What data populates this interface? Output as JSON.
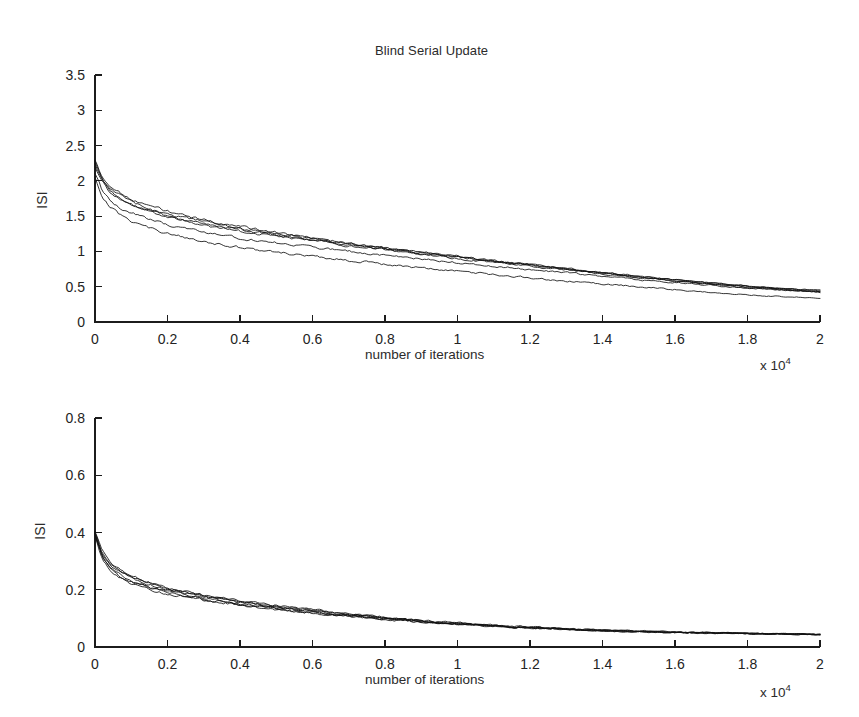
{
  "figure": {
    "title": "Blind Serial Update",
    "width": 859,
    "height": 717,
    "background": "#ffffff",
    "line_color": "#111111"
  },
  "panels": {
    "top": {
      "name": "top-panel",
      "title": "Blind Serial Update",
      "ylabel": "ISI",
      "xlabel": "number of iterations",
      "x_multiplier": "x 10",
      "x_multiplier_exponent": "4",
      "ylim": [
        0,
        3.5
      ],
      "xlim": [
        0,
        2
      ],
      "yticks": [
        "0",
        "0.5",
        "1",
        "1.5",
        "2",
        "2.5",
        "3",
        "3.5"
      ],
      "xticks": [
        "0",
        "0.2",
        "0.4",
        "0.6",
        "0.8",
        "1",
        "1.2",
        "1.4",
        "1.6",
        "1.8",
        "2"
      ]
    },
    "bottom": {
      "name": "bottom-panel",
      "ylabel": "ISI",
      "xlabel": "number of iterations",
      "x_multiplier": "x 10",
      "x_multiplier_exponent": "4",
      "ylim": [
        0,
        0.8
      ],
      "xlim": [
        0,
        2
      ],
      "yticks": [
        "0",
        "0.2",
        "0.4",
        "0.6",
        "0.8"
      ],
      "xticks": [
        "0",
        "0.2",
        "0.4",
        "0.6",
        "0.8",
        "1",
        "1.2",
        "1.4",
        "1.6",
        "1.8",
        "2"
      ]
    }
  },
  "chart_data": [
    {
      "type": "line",
      "title": "Blind Serial Update",
      "xlabel": "number of iterations",
      "ylabel": "ISI",
      "x_multiplier": 10000,
      "xlim": [
        0,
        2
      ],
      "ylim": [
        0,
        3.5
      ],
      "xticks": [
        0,
        0.2,
        0.4,
        0.6,
        0.8,
        1,
        1.2,
        1.4,
        1.6,
        1.8,
        2
      ],
      "yticks": [
        0,
        0.5,
        1,
        1.5,
        2,
        2.5,
        3,
        3.5
      ],
      "grid": false,
      "legend": null,
      "x": [
        0,
        0.02,
        0.04,
        0.06,
        0.08,
        0.1,
        0.15,
        0.2,
        0.25,
        0.3,
        0.35,
        0.4,
        0.45,
        0.5,
        0.55,
        0.6,
        0.65,
        0.7,
        0.75,
        0.8,
        0.85,
        0.9,
        0.95,
        1.0,
        1.05,
        1.1,
        1.15,
        1.2,
        1.25,
        1.3,
        1.35,
        1.4,
        1.45,
        1.5,
        1.55,
        1.6,
        1.65,
        1.7,
        1.75,
        1.8,
        1.85,
        1.9,
        1.95,
        2.0
      ],
      "series": [
        {
          "name": "run-1",
          "values": [
            2.3,
            2.05,
            1.94,
            1.86,
            1.8,
            1.75,
            1.65,
            1.57,
            1.5,
            1.45,
            1.4,
            1.35,
            1.31,
            1.27,
            1.23,
            1.19,
            1.15,
            1.12,
            1.08,
            1.05,
            1.02,
            0.99,
            0.96,
            0.93,
            0.9,
            0.87,
            0.84,
            0.81,
            0.78,
            0.75,
            0.72,
            0.69,
            0.66,
            0.63,
            0.61,
            0.58,
            0.56,
            0.54,
            0.52,
            0.5,
            0.48,
            0.46,
            0.45,
            0.44
          ]
        },
        {
          "name": "run-2",
          "values": [
            2.25,
            2.02,
            1.9,
            1.82,
            1.76,
            1.71,
            1.61,
            1.53,
            1.47,
            1.42,
            1.37,
            1.33,
            1.29,
            1.25,
            1.21,
            1.18,
            1.14,
            1.11,
            1.08,
            1.04,
            1.01,
            0.98,
            0.95,
            0.92,
            0.89,
            0.87,
            0.84,
            0.81,
            0.78,
            0.76,
            0.73,
            0.7,
            0.68,
            0.65,
            0.62,
            0.6,
            0.57,
            0.55,
            0.53,
            0.51,
            0.49,
            0.47,
            0.46,
            0.45
          ]
        },
        {
          "name": "run-3",
          "values": [
            2.2,
            1.98,
            1.85,
            1.77,
            1.71,
            1.66,
            1.57,
            1.5,
            1.44,
            1.39,
            1.35,
            1.31,
            1.27,
            1.23,
            1.2,
            1.16,
            1.13,
            1.1,
            1.06,
            1.03,
            1.0,
            0.97,
            0.94,
            0.92,
            0.89,
            0.86,
            0.83,
            0.81,
            0.78,
            0.75,
            0.73,
            0.7,
            0.67,
            0.65,
            0.62,
            0.6,
            0.57,
            0.55,
            0.53,
            0.51,
            0.49,
            0.47,
            0.45,
            0.43
          ]
        },
        {
          "name": "run-4",
          "values": [
            2.28,
            2.0,
            1.87,
            1.78,
            1.71,
            1.66,
            1.56,
            1.48,
            1.42,
            1.37,
            1.33,
            1.29,
            1.25,
            1.22,
            1.18,
            1.15,
            1.12,
            1.08,
            1.05,
            1.02,
            0.99,
            0.96,
            0.93,
            0.9,
            0.87,
            0.85,
            0.82,
            0.79,
            0.76,
            0.74,
            0.71,
            0.68,
            0.66,
            0.63,
            0.61,
            0.58,
            0.56,
            0.54,
            0.51,
            0.49,
            0.47,
            0.45,
            0.44,
            0.42
          ]
        },
        {
          "name": "run-5",
          "values": [
            2.1,
            1.86,
            1.73,
            1.65,
            1.59,
            1.54,
            1.45,
            1.38,
            1.32,
            1.27,
            1.23,
            1.19,
            1.15,
            1.12,
            1.09,
            1.06,
            1.03,
            1.0,
            0.97,
            0.94,
            0.92,
            0.89,
            0.87,
            0.84,
            0.82,
            0.79,
            0.77,
            0.74,
            0.72,
            0.7,
            0.67,
            0.65,
            0.63,
            0.6,
            0.58,
            0.56,
            0.54,
            0.52,
            0.5,
            0.48,
            0.47,
            0.45,
            0.44,
            0.43
          ]
        },
        {
          "name": "run-6",
          "values": [
            2.05,
            1.78,
            1.64,
            1.55,
            1.48,
            1.43,
            1.33,
            1.25,
            1.19,
            1.14,
            1.1,
            1.06,
            1.02,
            0.99,
            0.96,
            0.93,
            0.9,
            0.87,
            0.85,
            0.82,
            0.79,
            0.77,
            0.74,
            0.72,
            0.7,
            0.67,
            0.65,
            0.63,
            0.6,
            0.58,
            0.56,
            0.54,
            0.52,
            0.5,
            0.48,
            0.46,
            0.44,
            0.42,
            0.4,
            0.39,
            0.37,
            0.36,
            0.35,
            0.34
          ]
        }
      ]
    },
    {
      "type": "line",
      "title": "",
      "xlabel": "number of iterations",
      "ylabel": "ISI",
      "x_multiplier": 10000,
      "xlim": [
        0,
        2
      ],
      "ylim": [
        0,
        0.8
      ],
      "xticks": [
        0,
        0.2,
        0.4,
        0.6,
        0.8,
        1,
        1.2,
        1.4,
        1.6,
        1.8,
        2
      ],
      "yticks": [
        0,
        0.2,
        0.4,
        0.6,
        0.8
      ],
      "grid": false,
      "legend": null,
      "x": [
        0,
        0.02,
        0.04,
        0.06,
        0.08,
        0.1,
        0.15,
        0.2,
        0.25,
        0.3,
        0.35,
        0.4,
        0.45,
        0.5,
        0.55,
        0.6,
        0.65,
        0.7,
        0.75,
        0.8,
        0.85,
        0.9,
        0.95,
        1.0,
        1.05,
        1.1,
        1.15,
        1.2,
        1.25,
        1.3,
        1.35,
        1.4,
        1.45,
        1.5,
        1.55,
        1.6,
        1.65,
        1.7,
        1.75,
        1.8,
        1.85,
        1.9,
        1.95,
        2.0
      ],
      "series": [
        {
          "name": "run-1",
          "values": [
            0.4,
            0.33,
            0.295,
            0.272,
            0.256,
            0.244,
            0.221,
            0.205,
            0.192,
            0.18,
            0.17,
            0.16,
            0.151,
            0.143,
            0.135,
            0.128,
            0.121,
            0.114,
            0.108,
            0.102,
            0.096,
            0.091,
            0.086,
            0.082,
            0.078,
            0.074,
            0.071,
            0.068,
            0.065,
            0.062,
            0.06,
            0.058,
            0.056,
            0.054,
            0.052,
            0.051,
            0.05,
            0.049,
            0.048,
            0.047,
            0.046,
            0.045,
            0.045,
            0.044
          ]
        },
        {
          "name": "run-2",
          "values": [
            0.398,
            0.325,
            0.29,
            0.268,
            0.252,
            0.24,
            0.217,
            0.201,
            0.188,
            0.176,
            0.166,
            0.157,
            0.148,
            0.14,
            0.133,
            0.126,
            0.119,
            0.113,
            0.107,
            0.101,
            0.096,
            0.091,
            0.086,
            0.082,
            0.078,
            0.075,
            0.071,
            0.068,
            0.065,
            0.063,
            0.06,
            0.058,
            0.056,
            0.055,
            0.053,
            0.052,
            0.051,
            0.05,
            0.049,
            0.048,
            0.047,
            0.046,
            0.046,
            0.045
          ]
        },
        {
          "name": "run-3",
          "values": [
            0.395,
            0.318,
            0.282,
            0.26,
            0.244,
            0.232,
            0.21,
            0.195,
            0.182,
            0.171,
            0.161,
            0.152,
            0.144,
            0.136,
            0.129,
            0.122,
            0.116,
            0.11,
            0.104,
            0.099,
            0.094,
            0.089,
            0.085,
            0.081,
            0.077,
            0.074,
            0.07,
            0.067,
            0.065,
            0.062,
            0.06,
            0.058,
            0.056,
            0.054,
            0.052,
            0.051,
            0.05,
            0.049,
            0.048,
            0.047,
            0.046,
            0.045,
            0.044,
            0.043
          ]
        },
        {
          "name": "run-4",
          "values": [
            0.402,
            0.335,
            0.3,
            0.277,
            0.261,
            0.248,
            0.225,
            0.208,
            0.194,
            0.182,
            0.172,
            0.162,
            0.153,
            0.145,
            0.137,
            0.13,
            0.123,
            0.116,
            0.11,
            0.104,
            0.098,
            0.093,
            0.088,
            0.084,
            0.08,
            0.076,
            0.073,
            0.07,
            0.067,
            0.064,
            0.062,
            0.06,
            0.057,
            0.056,
            0.054,
            0.052,
            0.051,
            0.05,
            0.049,
            0.048,
            0.047,
            0.046,
            0.045,
            0.044
          ]
        },
        {
          "name": "run-5",
          "values": [
            0.393,
            0.312,
            0.277,
            0.255,
            0.24,
            0.228,
            0.206,
            0.191,
            0.179,
            0.168,
            0.158,
            0.149,
            0.141,
            0.134,
            0.127,
            0.12,
            0.114,
            0.108,
            0.103,
            0.098,
            0.093,
            0.088,
            0.084,
            0.08,
            0.076,
            0.073,
            0.07,
            0.067,
            0.064,
            0.062,
            0.059,
            0.057,
            0.055,
            0.054,
            0.052,
            0.051,
            0.05,
            0.049,
            0.048,
            0.047,
            0.046,
            0.045,
            0.044,
            0.043
          ]
        },
        {
          "name": "run-6",
          "values": [
            0.388,
            0.306,
            0.27,
            0.249,
            0.234,
            0.222,
            0.201,
            0.187,
            0.175,
            0.164,
            0.155,
            0.146,
            0.139,
            0.131,
            0.125,
            0.118,
            0.112,
            0.107,
            0.101,
            0.096,
            0.092,
            0.087,
            0.083,
            0.079,
            0.076,
            0.072,
            0.069,
            0.067,
            0.064,
            0.062,
            0.059,
            0.057,
            0.056,
            0.054,
            0.053,
            0.051,
            0.05,
            0.049,
            0.048,
            0.047,
            0.046,
            0.046,
            0.045,
            0.044
          ]
        }
      ]
    }
  ]
}
